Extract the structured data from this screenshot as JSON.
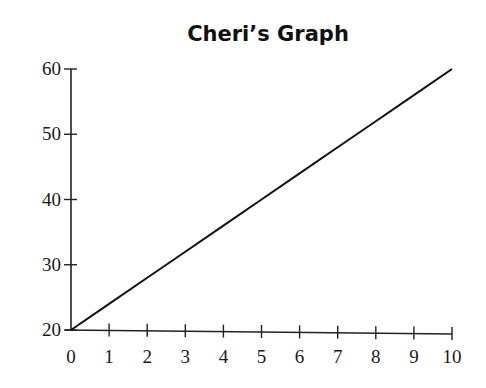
{
  "chart_data": {
    "type": "line",
    "title": "Cheri’s Graph",
    "xlabel": "",
    "ylabel": "",
    "x": [
      0,
      1,
      2,
      3,
      4,
      5,
      6,
      7,
      8,
      9,
      10
    ],
    "series": [
      {
        "name": "Cheri",
        "values": [
          20,
          24,
          28,
          32,
          36,
          40,
          44,
          48,
          52,
          56,
          60
        ]
      }
    ],
    "xlim": [
      0,
      10
    ],
    "ylim": [
      20,
      60
    ],
    "x_ticks": [
      "0",
      "1",
      "2",
      "3",
      "4",
      "5",
      "6",
      "7",
      "8",
      "9",
      "10"
    ],
    "y_ticks": [
      "20",
      "30",
      "40",
      "50",
      "60"
    ],
    "grid": false,
    "legend": "none",
    "line_color": "#111111"
  }
}
